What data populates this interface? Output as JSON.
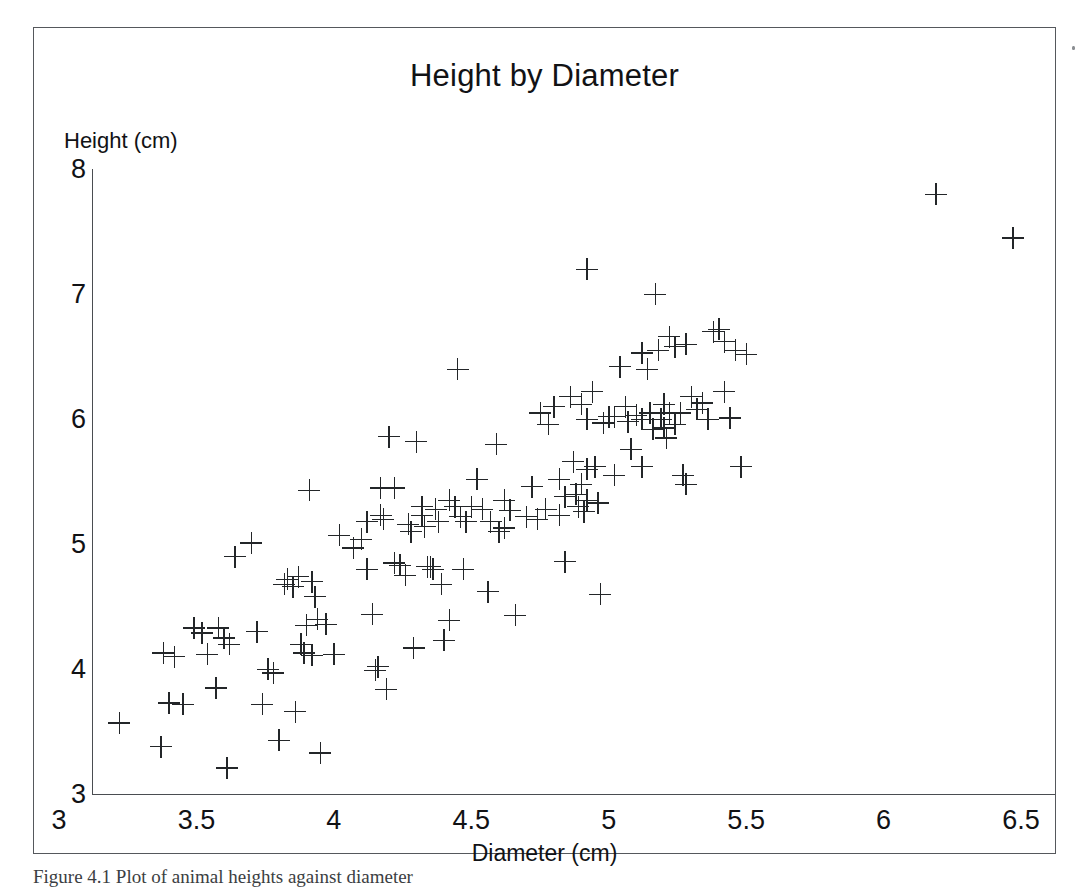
{
  "figure": {
    "caption": "Figure 4.1  Plot of animal heights against diameter"
  },
  "chart_data": {
    "type": "scatter",
    "title": "Height by Diameter",
    "xlabel": "Diameter (cm)",
    "ylabel": "Height (cm)",
    "xlim": [
      3,
      6.5
    ],
    "ylim": [
      3,
      8
    ],
    "xticks": [
      "3",
      "3.5",
      "4",
      "4.5",
      "5",
      "5.5",
      "6",
      "6.5"
    ],
    "xtick_values": [
      3,
      3.5,
      4,
      4.5,
      5,
      5.5,
      6,
      6.5
    ],
    "yticks": [
      "3",
      "4",
      "5",
      "6",
      "7",
      "8"
    ],
    "ytick_values": [
      3,
      4,
      5,
      6,
      7,
      8
    ],
    "grid": false,
    "legend": null,
    "marker": "plus",
    "marker_color": "#232629",
    "n_points": 158,
    "points": [
      [
        3.1,
        3.57
      ],
      [
        3.25,
        3.38
      ],
      [
        3.26,
        4.13
      ],
      [
        3.3,
        4.1
      ],
      [
        3.28,
        3.73
      ],
      [
        3.33,
        3.72
      ],
      [
        3.37,
        4.33
      ],
      [
        3.4,
        4.29
      ],
      [
        3.42,
        4.12
      ],
      [
        3.45,
        3.85
      ],
      [
        3.46,
        4.33
      ],
      [
        3.48,
        4.25
      ],
      [
        3.5,
        4.2
      ],
      [
        3.49,
        3.21
      ],
      [
        3.52,
        4.9
      ],
      [
        3.58,
        5.01
      ],
      [
        3.6,
        4.3
      ],
      [
        3.62,
        3.72
      ],
      [
        3.64,
        4.0
      ],
      [
        3.66,
        3.97
      ],
      [
        3.68,
        3.43
      ],
      [
        3.7,
        4.68
      ],
      [
        3.71,
        4.72
      ],
      [
        3.73,
        4.66
      ],
      [
        3.74,
        3.66
      ],
      [
        3.75,
        4.74
      ],
      [
        3.76,
        4.2
      ],
      [
        3.77,
        4.13
      ],
      [
        3.78,
        4.35
      ],
      [
        3.79,
        5.43
      ],
      [
        3.8,
        4.7
      ],
      [
        3.8,
        4.11
      ],
      [
        3.81,
        4.58
      ],
      [
        3.82,
        4.4
      ],
      [
        3.83,
        3.33
      ],
      [
        3.85,
        4.36
      ],
      [
        3.88,
        4.12
      ],
      [
        3.9,
        5.07
      ],
      [
        3.95,
        4.97
      ],
      [
        3.98,
        5.04
      ],
      [
        4.0,
        5.18
      ],
      [
        4.0,
        4.8
      ],
      [
        4.02,
        4.44
      ],
      [
        4.03,
        3.99
      ],
      [
        4.04,
        4.02
      ],
      [
        4.05,
        5.45
      ],
      [
        4.05,
        5.23
      ],
      [
        4.06,
        5.2
      ],
      [
        4.07,
        3.84
      ],
      [
        4.08,
        5.86
      ],
      [
        4.1,
        5.45
      ],
      [
        4.1,
        4.85
      ],
      [
        4.12,
        4.83
      ],
      [
        4.14,
        4.75
      ],
      [
        4.15,
        5.16
      ],
      [
        4.16,
        5.1
      ],
      [
        4.17,
        4.17
      ],
      [
        4.18,
        5.82
      ],
      [
        4.2,
        5.3
      ],
      [
        4.2,
        5.23
      ],
      [
        4.21,
        5.14
      ],
      [
        4.22,
        4.82
      ],
      [
        4.23,
        4.82
      ],
      [
        4.24,
        4.8
      ],
      [
        4.25,
        5.28
      ],
      [
        4.26,
        5.18
      ],
      [
        4.27,
        4.68
      ],
      [
        4.28,
        4.23
      ],
      [
        4.3,
        5.35
      ],
      [
        4.3,
        4.39
      ],
      [
        4.32,
        5.3
      ],
      [
        4.33,
        6.4
      ],
      [
        4.34,
        5.22
      ],
      [
        4.35,
        4.8
      ],
      [
        4.36,
        5.18
      ],
      [
        4.38,
        5.3
      ],
      [
        4.4,
        5.52
      ],
      [
        4.42,
        5.28
      ],
      [
        4.44,
        4.62
      ],
      [
        4.45,
        5.18
      ],
      [
        4.47,
        5.8
      ],
      [
        4.48,
        5.1
      ],
      [
        4.5,
        5.35
      ],
      [
        4.5,
        5.13
      ],
      [
        4.52,
        5.27
      ],
      [
        4.54,
        4.43
      ],
      [
        4.58,
        5.22
      ],
      [
        4.6,
        5.46
      ],
      [
        4.62,
        5.2
      ],
      [
        4.63,
        6.05
      ],
      [
        4.65,
        5.28
      ],
      [
        4.66,
        5.96
      ],
      [
        4.68,
        6.1
      ],
      [
        4.7,
        5.52
      ],
      [
        4.7,
        5.23
      ],
      [
        4.72,
        5.38
      ],
      [
        4.72,
        4.86
      ],
      [
        4.74,
        6.18
      ],
      [
        4.75,
        5.66
      ],
      [
        4.76,
        5.4
      ],
      [
        4.77,
        5.3
      ],
      [
        4.78,
        6.12
      ],
      [
        4.78,
        5.48
      ],
      [
        4.79,
        5.26
      ],
      [
        4.8,
        7.2
      ],
      [
        4.8,
        6.0
      ],
      [
        4.8,
        5.6
      ],
      [
        4.8,
        5.35
      ],
      [
        4.82,
        6.22
      ],
      [
        4.83,
        5.62
      ],
      [
        4.84,
        5.33
      ],
      [
        4.85,
        4.6
      ],
      [
        4.86,
        5.97
      ],
      [
        4.88,
        6.02
      ],
      [
        4.9,
        6.02
      ],
      [
        4.9,
        5.55
      ],
      [
        4.92,
        6.42
      ],
      [
        4.94,
        6.1
      ],
      [
        4.95,
        5.98
      ],
      [
        4.96,
        5.76
      ],
      [
        4.98,
        6.03
      ],
      [
        5.0,
        6.53
      ],
      [
        5.0,
        6.0
      ],
      [
        5.0,
        5.62
      ],
      [
        5.02,
        6.4
      ],
      [
        5.03,
        6.05
      ],
      [
        5.04,
        5.92
      ],
      [
        5.05,
        7.0
      ],
      [
        5.06,
        6.55
      ],
      [
        5.07,
        6.0
      ],
      [
        5.08,
        6.12
      ],
      [
        5.08,
        5.93
      ],
      [
        5.09,
        5.85
      ],
      [
        5.1,
        6.66
      ],
      [
        5.1,
        6.05
      ],
      [
        5.12,
        6.58
      ],
      [
        5.12,
        5.96
      ],
      [
        5.14,
        6.05
      ],
      [
        5.15,
        5.55
      ],
      [
        5.16,
        6.6
      ],
      [
        5.16,
        5.48
      ],
      [
        5.18,
        6.18
      ],
      [
        5.2,
        6.08
      ],
      [
        5.22,
        6.13
      ],
      [
        5.24,
        6.0
      ],
      [
        5.26,
        6.7
      ],
      [
        5.28,
        6.72
      ],
      [
        5.3,
        6.62
      ],
      [
        5.3,
        6.22
      ],
      [
        5.32,
        6.01
      ],
      [
        5.34,
        6.55
      ],
      [
        5.36,
        5.62
      ],
      [
        5.38,
        6.52
      ],
      [
        6.07,
        7.8
      ],
      [
        6.35,
        7.45
      ]
    ]
  }
}
